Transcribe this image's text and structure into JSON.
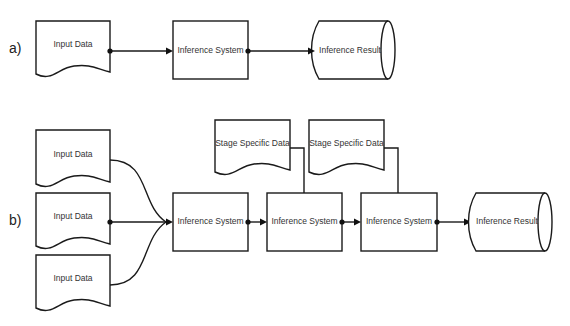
{
  "panels": {
    "a": {
      "label": "a)",
      "input": "Input Data",
      "system": "Inference System",
      "result": "Inference Result"
    },
    "b": {
      "label": "b)",
      "inputs": [
        "Input Data",
        "Input Data",
        "Input Data"
      ],
      "stage_data": [
        "Stage Specific Data",
        "Stage Specific Data"
      ],
      "systems": [
        "Inference System",
        "Inference System",
        "Inference System"
      ],
      "result": "Inference Result"
    }
  },
  "colors": {
    "stroke": "#1a1a1a",
    "fill": "#ffffff",
    "text": "#333333"
  }
}
